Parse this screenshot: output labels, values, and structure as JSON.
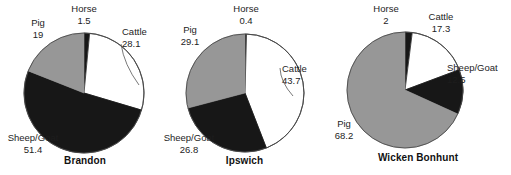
{
  "figure": {
    "background": "#ffffff",
    "text_color": "#1d1d1d"
  },
  "colors": {
    "cattle": "#ffffff",
    "sheep_goat": "#171717",
    "pig": "#979797",
    "horse": "#171717",
    "outline": "#4a4a4a"
  },
  "chart_data": [
    {
      "type": "pie",
      "title": "Brandon",
      "categories": [
        "Horse",
        "Cattle",
        "Sheep/Goat",
        "Pig"
      ],
      "values": [
        1.5,
        28.1,
        51.4,
        19.0
      ],
      "labels": [
        "1.5",
        "28.1",
        "51.4",
        "19"
      ],
      "colors": [
        "#171717",
        "#ffffff",
        "#171717",
        "#979797"
      ],
      "start_angle": 0,
      "direction": "clockwise",
      "legend": "none",
      "xlabel": "",
      "ylabel": ""
    },
    {
      "type": "pie",
      "title": "Ipswich",
      "categories": [
        "Horse",
        "Cattle",
        "Sheep/Goat",
        "Pig"
      ],
      "values": [
        0.4,
        43.7,
        26.8,
        29.1
      ],
      "labels": [
        "0.4",
        "43.7",
        "26.8",
        "29.1"
      ],
      "colors": [
        "#171717",
        "#ffffff",
        "#171717",
        "#979797"
      ],
      "start_angle": 0,
      "direction": "clockwise",
      "legend": "none",
      "xlabel": "",
      "ylabel": ""
    },
    {
      "type": "pie",
      "title": "Wicken Bonhunt",
      "categories": [
        "Horse",
        "Cattle",
        "Sheep/Goat",
        "Pig"
      ],
      "values": [
        2.0,
        17.3,
        12.5,
        68.2
      ],
      "labels": [
        "2",
        "17.3",
        "12.5",
        "68.2"
      ],
      "colors": [
        "#171717",
        "#ffffff",
        "#171717",
        "#979797"
      ],
      "start_angle": 0,
      "direction": "clockwise",
      "legend": "none",
      "xlabel": "",
      "ylabel": ""
    }
  ],
  "charts": [
    {
      "id": "brandon",
      "title": "Brandon",
      "cx": 84,
      "cy": 93,
      "r": 60,
      "title_top": 155,
      "labels": [
        {
          "name": "Horse",
          "value": "1.5",
          "x": 58,
          "y": 3,
          "w": 52,
          "align": "center",
          "leader": null
        },
        {
          "name": "Cattle",
          "value": "28.1",
          "x": 122,
          "y": 26,
          "w": 44,
          "align": "left",
          "leader": {
            "x1": 121,
            "y1": 44,
            "x2": 139,
            "y2": 85,
            "curve": true
          }
        },
        {
          "name": "Sheep/Goat",
          "value": "51.4",
          "x": 2,
          "y": 132,
          "w": 62,
          "align": "center",
          "leader": null
        },
        {
          "name": "Pig",
          "value": "19",
          "x": 22,
          "y": 17,
          "w": 32,
          "align": "center",
          "leader": null
        }
      ]
    },
    {
      "id": "ipswich",
      "title": "Ipswich",
      "cx": 83,
      "cy": 93,
      "r": 59,
      "title_top": 155,
      "labels": [
        {
          "name": "Horse",
          "value": "0.4",
          "x": 58,
          "y": 3,
          "w": 52,
          "align": "center",
          "leader": null
        },
        {
          "name": "Cattle",
          "value": "43.7",
          "x": 120,
          "y": 63,
          "w": 44,
          "align": "left",
          "leader": {
            "x1": 118,
            "y1": 68,
            "x2": 131,
            "y2": 96,
            "curve": true
          }
        },
        {
          "name": "Sheep/Goat",
          "value": "26.8",
          "x": -4,
          "y": 132,
          "w": 62,
          "align": "center",
          "leader": null
        },
        {
          "name": "Pig",
          "value": "29.1",
          "x": 10,
          "y": 24,
          "w": 36,
          "align": "center",
          "leader": null
        }
      ]
    },
    {
      "id": "wicken",
      "title": "Wicken Bonhunt",
      "cx": 80,
      "cy": 90,
      "r": 58,
      "title_top": 152,
      "labels": [
        {
          "name": "Horse",
          "value": "2",
          "x": 38,
          "y": 3,
          "w": 46,
          "align": "center",
          "leader": null
        },
        {
          "name": "Cattle",
          "value": "17.3",
          "x": 94,
          "y": 11,
          "w": 44,
          "align": "center",
          "leader": null
        },
        {
          "name": "Sheep/Goat",
          "value": "12.5",
          "x": 122,
          "y": 62,
          "w": 62,
          "align": "left",
          "leader": null
        },
        {
          "name": "Pig",
          "value": "68.2",
          "x": 2,
          "y": 118,
          "w": 34,
          "align": "center",
          "leader": null
        }
      ]
    }
  ]
}
